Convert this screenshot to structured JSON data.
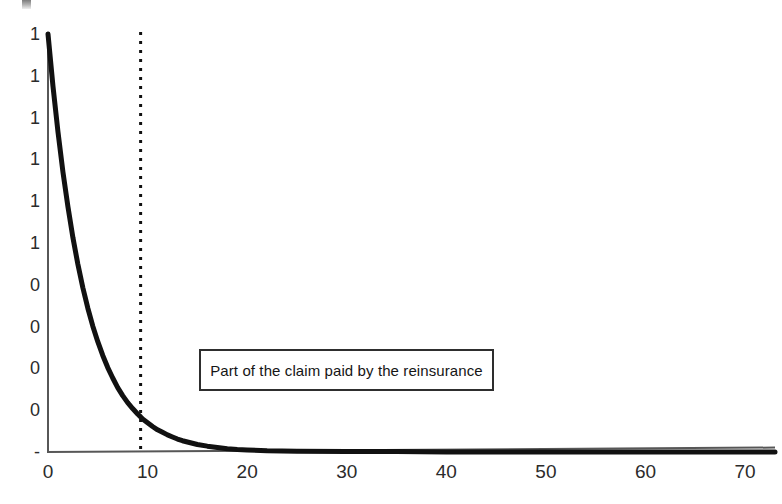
{
  "chart_data": {
    "type": "line",
    "title": "",
    "subtitle": "",
    "xlabel": "",
    "ylabel": "",
    "xlim": [
      0,
      73
    ],
    "ylim": [
      0,
      1.0
    ],
    "grid": false,
    "legend": false,
    "x_ticks": [
      "0",
      "10",
      "20",
      "30",
      "40",
      "50",
      "60",
      "70"
    ],
    "x_tick_values": [
      0,
      10,
      20,
      30,
      40,
      50,
      60,
      70
    ],
    "y_ticks": [
      "1",
      "1",
      "1",
      "1",
      "1",
      "1",
      "0",
      "0",
      "0",
      "0",
      "-"
    ],
    "y_tick_values": [
      1.0,
      0.9,
      0.8,
      0.7,
      0.6,
      0.5,
      0.4,
      0.3,
      0.2,
      0.1,
      0.0
    ],
    "series": [
      {
        "name": "Part of the claim paid by the reinsurance",
        "type": "line",
        "color": "#111111",
        "linewidth": 5,
        "x": [
          0,
          0.5,
          1,
          1.5,
          2,
          2.5,
          3,
          3.5,
          4,
          4.5,
          5,
          5.5,
          6,
          6.5,
          7,
          7.5,
          8,
          8.5,
          9,
          9.3,
          9.5,
          10,
          10.5,
          11,
          11.5,
          12,
          12.5,
          13,
          13.5,
          14,
          14.5,
          15,
          16,
          17,
          18,
          19,
          20,
          22,
          25,
          30,
          35,
          40,
          45,
          50,
          55,
          60,
          65,
          70,
          73
        ],
        "y": [
          1.0,
          0.875,
          0.766,
          0.67,
          0.587,
          0.513,
          0.449,
          0.393,
          0.344,
          0.301,
          0.264,
          0.231,
          0.202,
          0.177,
          0.154,
          0.135,
          0.118,
          0.104,
          0.091,
          0.084,
          0.079,
          0.07,
          0.061,
          0.053,
          0.047,
          0.041,
          0.036,
          0.031,
          0.027,
          0.024,
          0.021,
          0.018,
          0.014,
          0.011,
          0.008,
          0.006,
          0.005,
          0.003,
          0.002,
          0.001,
          0.001,
          0.0,
          0.0,
          0.0,
          0.0,
          0.0,
          0.0,
          0.0,
          0.0
        ]
      }
    ],
    "reference_lines": [
      {
        "name": "retention-threshold",
        "orientation": "vertical",
        "x": 9.3,
        "style": "dotted",
        "color": "#111111",
        "linewidth": 3
      }
    ],
    "annotations": [
      {
        "name": "reinsurance-share-label",
        "text": "Part of the claim paid by the reinsurance",
        "boxed": true,
        "x": 19,
        "y": 0.165
      }
    ]
  },
  "annotation": {
    "text": "Part of the claim paid by the reinsurance"
  },
  "axes": {
    "x_ticks": [
      "0",
      "10",
      "20",
      "30",
      "40",
      "50",
      "60",
      "70"
    ],
    "y_ticks": [
      "1",
      "1",
      "1",
      "1",
      "1",
      "1",
      "0",
      "0",
      "0",
      "0",
      "-"
    ]
  },
  "colors": {
    "curve": "#111111",
    "axis": "#575757",
    "reference_line": "#111111",
    "annotation_border": "#2e2e2e",
    "background": "#ffffff"
  }
}
